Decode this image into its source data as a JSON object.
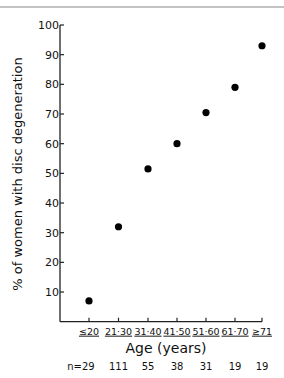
{
  "chart_data": {
    "type": "scatter",
    "title": "",
    "xlabel": "Age (years)",
    "ylabel": "% of women with disc degeneration",
    "categories": [
      "<20",
      "21-30",
      "31-40",
      "41-50",
      "51-60",
      "61-70",
      ">71"
    ],
    "category_display": [
      "≤20",
      "21·30",
      "31·40",
      "41·50",
      "51·60",
      "61·70",
      "≥71"
    ],
    "values": [
      7,
      32,
      51.5,
      60,
      70.5,
      79,
      93
    ],
    "sample_sizes": [
      "n=29",
      "111",
      "55",
      "38",
      "31",
      "19",
      "19"
    ],
    "ylim": [
      0,
      100
    ],
    "yticks": [
      10,
      20,
      30,
      40,
      50,
      60,
      70,
      80,
      90,
      100
    ],
    "grid": false,
    "legend": "none",
    "marker": "filled-circle",
    "colors": {
      "marker": "#000000",
      "axis": "#222222",
      "top_rule": "#888888"
    }
  }
}
